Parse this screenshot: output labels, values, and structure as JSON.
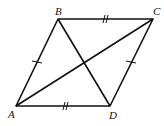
{
  "figure": {
    "type": "rhombus",
    "vertices": {
      "A": {
        "label": "A",
        "x": 16,
        "y": 106
      },
      "B": {
        "label": "B",
        "x": 58,
        "y": 19
      },
      "C": {
        "label": "C",
        "x": 153,
        "y": 19
      },
      "D": {
        "label": "D",
        "x": 110,
        "y": 106
      }
    },
    "sides": [
      "AB",
      "BC",
      "CD",
      "DA"
    ],
    "diagonals": [
      "AC",
      "BD"
    ],
    "tick_marks": {
      "AB": 1,
      "CD": 1,
      "BC": 2,
      "AD": 2
    },
    "stroke_color": "#111111"
  }
}
